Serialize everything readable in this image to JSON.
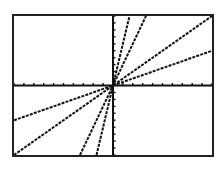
{
  "chart_data": {
    "type": "line",
    "title": "",
    "xlabel": "",
    "ylabel": "",
    "xlim": [
      -10,
      10
    ],
    "ylim": [
      -10,
      10
    ],
    "xscl": 1,
    "yscl": 1,
    "grid": false,
    "axes": true,
    "legend": null,
    "series": [
      {
        "name": "Y1",
        "equation": "y = 0.5x",
        "slope": 0.5,
        "intercept": 0
      },
      {
        "name": "Y2",
        "equation": "y = x",
        "slope": 1,
        "intercept": 0
      },
      {
        "name": "Y3",
        "equation": "y = 3x",
        "slope": 3,
        "intercept": 0
      },
      {
        "name": "Y4",
        "equation": "y = 6x",
        "slope": 6,
        "intercept": 0
      }
    ]
  },
  "screen": {
    "background": "#ffffff",
    "line_color": "#111111",
    "frame_color": "#222222"
  }
}
